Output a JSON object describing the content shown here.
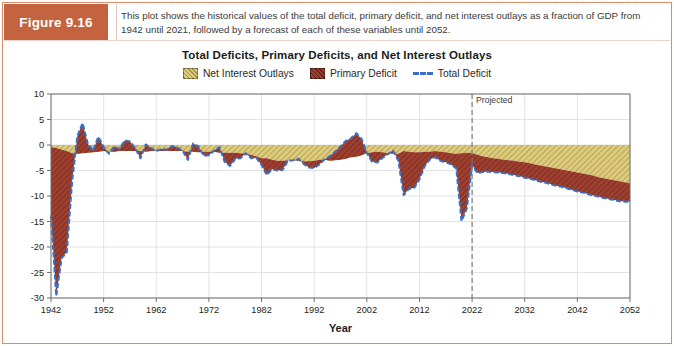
{
  "figure": {
    "tag": "Figure 9.16",
    "caption": "This plot shows the historical values of the total deficit, primary deficit, and net interest outlays as a fraction of GDP from 1942 until 2021, followed by a forecast of each of these variables until 2052."
  },
  "colors": {
    "tag_background": "#c4633f",
    "frame_border": "#d98b6a",
    "net_interest": "#ddcb7e",
    "primary_deficit": "#9e3f2f",
    "total_deficit_line": "#3a6fc4",
    "projection_divider": "#7a7a7a",
    "grid": "#dcdcdc",
    "axis": "#6f6f6f"
  },
  "chart_data": {
    "type": "area",
    "title": "Total Deficits, Primary Deficits, and Net Interest Outlays",
    "xlabel": "Year",
    "ylabel": "",
    "xlim": [
      1942,
      2052
    ],
    "ylim": [
      -30,
      10
    ],
    "grid": true,
    "legend_position": "top-center",
    "xticks": [
      1942,
      1952,
      1962,
      1972,
      1982,
      1992,
      2002,
      2012,
      2022,
      2032,
      2042,
      2052
    ],
    "yticks": [
      10,
      5,
      0,
      -5,
      -10,
      -15,
      -20,
      -25,
      -30
    ],
    "annotations": [
      {
        "text": "Projected",
        "x": 2022,
        "y": 8.2,
        "style": "dashed-vertical-line"
      }
    ],
    "legend": [
      {
        "label": "Net Interest Outlays",
        "color": "#ddcb7e",
        "style": "hatched-area"
      },
      {
        "label": "Primary Deficit",
        "color": "#9e3f2f",
        "style": "hatched-area"
      },
      {
        "label": "Total Deficit",
        "color": "#3a6fc4",
        "style": "dashed-line"
      }
    ],
    "x": [
      1942,
      1943,
      1944,
      1945,
      1946,
      1947,
      1948,
      1949,
      1950,
      1951,
      1952,
      1953,
      1954,
      1955,
      1956,
      1957,
      1958,
      1959,
      1960,
      1961,
      1962,
      1963,
      1964,
      1965,
      1966,
      1967,
      1968,
      1969,
      1970,
      1971,
      1972,
      1973,
      1974,
      1975,
      1976,
      1977,
      1978,
      1979,
      1980,
      1981,
      1982,
      1983,
      1984,
      1985,
      1986,
      1987,
      1988,
      1989,
      1990,
      1991,
      1992,
      1993,
      1994,
      1995,
      1996,
      1997,
      1998,
      1999,
      2000,
      2001,
      2002,
      2003,
      2004,
      2005,
      2006,
      2007,
      2008,
      2009,
      2010,
      2011,
      2012,
      2013,
      2014,
      2015,
      2016,
      2017,
      2018,
      2019,
      2020,
      2021,
      2022,
      2023,
      2024,
      2025,
      2026,
      2027,
      2028,
      2029,
      2030,
      2031,
      2032,
      2033,
      2034,
      2035,
      2036,
      2037,
      2038,
      2039,
      2040,
      2041,
      2042,
      2043,
      2044,
      2045,
      2046,
      2047,
      2048,
      2049,
      2050,
      2051,
      2052
    ],
    "series": [
      {
        "name": "Total Deficit",
        "note": "surplus positive / deficit negative, percent of GDP",
        "values": [
          -13.8,
          -29.6,
          -22.2,
          -21.0,
          -7.2,
          1.7,
          4.3,
          0.2,
          -1.1,
          1.6,
          -0.4,
          -1.7,
          -0.3,
          -0.8,
          0.9,
          0.7,
          -0.6,
          -2.6,
          0.1,
          -0.6,
          -1.2,
          -0.8,
          -0.9,
          -0.2,
          -0.5,
          -1.1,
          -2.9,
          0.3,
          -0.3,
          -2.1,
          -2.0,
          -1.1,
          -0.4,
          -3.3,
          -4.1,
          -2.7,
          -2.6,
          -1.6,
          -2.6,
          -2.5,
          -3.9,
          -5.9,
          -4.7,
          -5.0,
          -4.9,
          -3.1,
          -3.0,
          -2.7,
          -3.7,
          -4.4,
          -4.5,
          -3.8,
          -2.8,
          -2.2,
          -1.3,
          -0.3,
          0.8,
          1.3,
          2.3,
          1.2,
          -1.5,
          -3.3,
          -3.4,
          -2.5,
          -1.8,
          -1.1,
          -3.1,
          -9.8,
          -8.6,
          -8.4,
          -6.7,
          -4.1,
          -2.8,
          -2.4,
          -3.1,
          -3.4,
          -3.8,
          -4.6,
          -14.9,
          -12.4,
          -3.9,
          -5.5,
          -5.3,
          -5.2,
          -5.3,
          -5.4,
          -5.5,
          -5.7,
          -5.9,
          -6.1,
          -6.4,
          -6.6,
          -6.9,
          -7.2,
          -7.4,
          -7.7,
          -8.0,
          -8.2,
          -8.5,
          -8.8,
          -9.1,
          -9.3,
          -9.6,
          -9.9,
          -10.1,
          -10.4,
          -10.6,
          -10.8,
          -11.0,
          -11.1,
          -11.1
        ]
      },
      {
        "name": "Net Interest Outlays",
        "note": "always a cost; plotted as a negative band adjacent to zero",
        "values": [
          0.4,
          0.6,
          0.9,
          1.2,
          1.6,
          1.7,
          1.6,
          1.5,
          1.4,
          1.3,
          1.2,
          1.3,
          1.3,
          1.2,
          1.2,
          1.2,
          1.2,
          1.2,
          1.3,
          1.2,
          1.2,
          1.2,
          1.2,
          1.2,
          1.2,
          1.2,
          1.3,
          1.3,
          1.4,
          1.3,
          1.3,
          1.3,
          1.5,
          1.5,
          1.5,
          1.5,
          1.6,
          1.7,
          1.9,
          2.2,
          2.6,
          2.6,
          2.9,
          3.1,
          3.1,
          3.0,
          3.0,
          3.1,
          3.2,
          3.2,
          3.1,
          2.9,
          2.9,
          3.1,
          3.0,
          2.9,
          2.7,
          2.4,
          2.3,
          2.0,
          1.6,
          1.4,
          1.3,
          1.4,
          1.6,
          1.7,
          1.7,
          1.2,
          1.3,
          1.4,
          1.4,
          1.3,
          1.3,
          1.2,
          1.3,
          1.4,
          1.6,
          1.7,
          1.6,
          1.5,
          1.6,
          1.9,
          2.2,
          2.4,
          2.6,
          2.7,
          2.9,
          3.0,
          3.1,
          3.3,
          3.4,
          3.6,
          3.8,
          4.0,
          4.2,
          4.4,
          4.6,
          4.8,
          5.0,
          5.2,
          5.4,
          5.6,
          5.8,
          6.0,
          6.3,
          6.5,
          6.7,
          6.9,
          7.1,
          7.3,
          7.5
        ]
      },
      {
        "name": "Primary Deficit",
        "note": "total deficit excluding net interest; positive value = primary surplus",
        "values": [
          -13.4,
          -29.0,
          -21.3,
          -19.8,
          -5.6,
          3.4,
          5.9,
          1.7,
          0.3,
          2.9,
          0.8,
          -0.4,
          1.0,
          0.4,
          2.1,
          1.9,
          0.6,
          -1.4,
          1.4,
          0.6,
          0.0,
          0.4,
          0.3,
          1.0,
          0.7,
          0.1,
          -1.6,
          1.6,
          1.1,
          -0.8,
          -0.7,
          0.2,
          1.1,
          -1.8,
          -2.6,
          -1.2,
          -1.0,
          0.1,
          -0.7,
          -0.3,
          -1.3,
          -3.3,
          -1.8,
          -1.9,
          -1.8,
          -0.1,
          0.0,
          0.4,
          -0.5,
          -1.2,
          -1.4,
          -0.9,
          0.1,
          0.9,
          1.7,
          2.6,
          3.5,
          3.7,
          4.6,
          3.2,
          0.1,
          -1.9,
          -2.1,
          -1.1,
          -0.2,
          0.6,
          -1.4,
          -8.6,
          -7.3,
          -7.0,
          -5.3,
          -2.8,
          -1.5,
          -1.2,
          -1.8,
          -2.0,
          -2.2,
          -2.9,
          -13.3,
          -10.9,
          -2.3,
          -3.6,
          -3.3,
          -2.9,
          -2.7,
          -2.6,
          -2.5,
          -2.5,
          -2.6,
          -2.6,
          -2.7,
          -2.8,
          -2.8,
          -2.9,
          -3.0,
          -3.0,
          -3.1,
          -3.2,
          -3.3,
          -3.4,
          -3.5,
          -3.5,
          -3.6,
          -3.6,
          -3.6,
          -3.7,
          -3.7,
          -3.7,
          -3.7,
          -3.6,
          -3.6
        ]
      }
    ]
  }
}
